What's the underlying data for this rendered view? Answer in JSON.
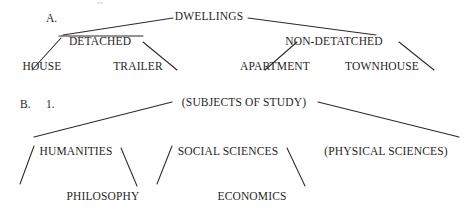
{
  "document": {
    "title": "Hierarchical tree diagrams of dwellings and subjects of study",
    "ink_color": "#1f1f1f",
    "background_color": "#ffffff"
  },
  "sections": [
    {
      "marker": "A.",
      "marker_x": 46,
      "marker_y": 19,
      "tree": {
        "type": "tree",
        "root": {
          "text": "DWELLINGS",
          "x": 209,
          "y": 17
        },
        "level2": [
          {
            "text": "DETACHED",
            "x": 100,
            "y": 42
          },
          {
            "text": "NON-DETATCHED",
            "x": 334,
            "y": 42
          }
        ],
        "level3": [
          {
            "text": "HOUSE",
            "x": 42,
            "y": 67
          },
          {
            "text": "TRAILER",
            "x": 138,
            "y": 67
          },
          {
            "text": "APARTMENT",
            "x": 275,
            "y": 67
          },
          {
            "text": "TOWNHOUSE",
            "x": 382,
            "y": 67
          }
        ]
      }
    },
    {
      "marker": "B.",
      "marker_x": 20,
      "marker_y": 105,
      "sub_marker": "1.",
      "sub_marker_x": 46,
      "sub_marker_y": 105,
      "tree": {
        "type": "tree",
        "root": {
          "text": "(SUBJECTS OF STUDY)",
          "x": 244,
          "y": 103
        },
        "level2": [
          {
            "text": "HUMANITIES",
            "x": 76,
            "y": 152
          },
          {
            "text": "SOCIAL SCIENCES",
            "x": 228,
            "y": 152
          },
          {
            "text": "(PHYSICAL SCIENCES)",
            "x": 386,
            "y": 152
          }
        ],
        "level3": [
          {
            "text": "PHILOSOPHY",
            "x": 103,
            "y": 197
          },
          {
            "text": "ECONOMICS",
            "x": 252,
            "y": 197
          }
        ]
      }
    }
  ],
  "edges": {
    "stroke": "#2a2a2a",
    "width": 1.05,
    "segments": [
      {
        "name": "dwellings-to-detached",
        "x1": 173,
        "y1": 18,
        "x2": 63,
        "y2": 35
      },
      {
        "name": "dwellings-to-non-detatched",
        "x1": 248,
        "y1": 18,
        "x2": 376,
        "y2": 35
      },
      {
        "name": "detached-left-branch",
        "x1": 59,
        "y1": 36,
        "x2": 143,
        "y2": 36
      },
      {
        "name": "detached-to-house",
        "x1": 61,
        "y1": 38,
        "x2": 32,
        "y2": 70
      },
      {
        "name": "detached-to-trailer",
        "x1": 143,
        "y1": 42,
        "x2": 177,
        "y2": 70
      },
      {
        "name": "non-detatched-to-apartment",
        "x1": 297,
        "y1": 42,
        "x2": 265,
        "y2": 70
      },
      {
        "name": "non-detatched-to-townhouse",
        "x1": 399,
        "y1": 42,
        "x2": 434,
        "y2": 70
      },
      {
        "name": "subjects-to-humanities",
        "x1": 172,
        "y1": 102,
        "x2": 34,
        "y2": 137
      },
      {
        "name": "subjects-to-physical-sciences",
        "x1": 318,
        "y1": 102,
        "x2": 459,
        "y2": 137
      },
      {
        "name": "humanities-to-philosophy",
        "x1": 34,
        "y1": 146,
        "x2": 20,
        "y2": 184
      },
      {
        "name": "humanities-right-branch",
        "x1": 121,
        "y1": 148,
        "x2": 137,
        "y2": 186
      },
      {
        "name": "social-sciences-left-branch",
        "x1": 172,
        "y1": 146,
        "x2": 157,
        "y2": 184
      },
      {
        "name": "social-sciences-right-branch",
        "x1": 287,
        "y1": 148,
        "x2": 305,
        "y2": 186
      }
    ]
  }
}
